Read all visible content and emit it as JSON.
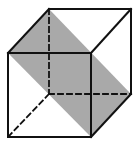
{
  "diagram": {
    "type": "cube-with-diagonal-plane",
    "colors": {
      "background": "#ffffff",
      "edge": "#111111",
      "shading": "#a9a9a9"
    },
    "vertices": {
      "back_top_left": [
        49,
        9
      ],
      "back_top_right": [
        131,
        9
      ],
      "front_top_left": [
        8,
        53
      ],
      "front_top_right": [
        91,
        53
      ],
      "front_bottom_left": [
        8,
        137
      ],
      "front_bottom_right": [
        91,
        137
      ],
      "back_bottom_left": [
        49,
        94
      ],
      "back_bottom_right": [
        131,
        94
      ]
    },
    "shaded_plane": [
      "back_top_left",
      "front_top_left",
      "front_bottom_right",
      "back_bottom_right"
    ],
    "visible_edges": [
      [
        "back_top_left",
        "back_top_right"
      ],
      [
        "back_top_left",
        "front_top_left"
      ],
      [
        "back_top_right",
        "front_top_right"
      ],
      [
        "back_top_right",
        "back_bottom_right"
      ],
      [
        "front_top_left",
        "front_top_right"
      ],
      [
        "front_top_left",
        "front_bottom_left"
      ],
      [
        "front_top_right",
        "front_bottom_right"
      ],
      [
        "front_bottom_left",
        "front_bottom_right"
      ],
      [
        "front_bottom_right",
        "back_bottom_right"
      ]
    ],
    "hidden_edges": [
      [
        "back_top_left",
        "back_bottom_left"
      ],
      [
        "back_bottom_left",
        "back_bottom_right"
      ],
      [
        "back_bottom_left",
        "front_bottom_left"
      ]
    ]
  }
}
